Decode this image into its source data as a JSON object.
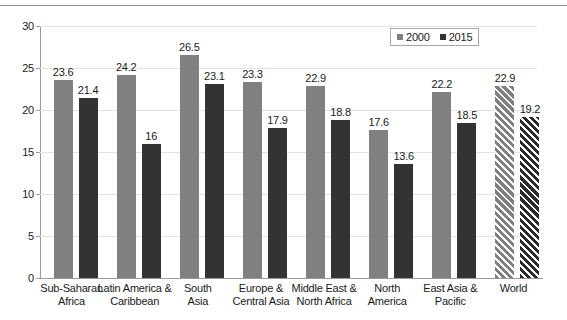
{
  "chart_data": {
    "type": "bar",
    "title": "",
    "subtitle": "",
    "xlabel": "",
    "ylabel": "",
    "ylim": [
      0,
      30
    ],
    "yticks": [
      0,
      5,
      10,
      15,
      20,
      25,
      30
    ],
    "ytick_labels": [
      "0",
      "5",
      "10",
      "15",
      "20",
      "25",
      "30"
    ],
    "grid": true,
    "legend_position": "top-right",
    "categories": [
      "Sub-Saharan Africa",
      "Latin America & Caribbean",
      "South Asia",
      "Europe & Central Asia",
      "Middle East & North Africa",
      "North America",
      "East Asia & Pacific",
      "World"
    ],
    "category_lines": [
      [
        "Sub-Saharan",
        "Africa"
      ],
      [
        "Latin America &",
        "Caribbean"
      ],
      [
        "South",
        "Asia"
      ],
      [
        "Europe &",
        "Central Asia"
      ],
      [
        "Middle East &",
        "North Africa"
      ],
      [
        "North",
        "America"
      ],
      [
        "East Asia &",
        "Pacific"
      ],
      [
        "World",
        ""
      ]
    ],
    "series": [
      {
        "name": "2000",
        "color": "#808080",
        "values": [
          23.6,
          24.2,
          26.5,
          23.3,
          22.9,
          17.6,
          22.2,
          22.9
        ],
        "labels": [
          "23.6",
          "24.2",
          "26.5",
          "23.3",
          "22.9",
          "17.6",
          "22.2",
          "22.9"
        ]
      },
      {
        "name": "2015",
        "color": "#333333",
        "values": [
          21.4,
          16,
          23.1,
          17.9,
          18.8,
          13.6,
          18.5,
          19.2
        ],
        "labels": [
          "21.4",
          "16",
          "23.1",
          "17.9",
          "18.8",
          "13.6",
          "18.5",
          "19.2"
        ]
      }
    ],
    "highlighted_category": "World",
    "highlight_style": "diagonal-hatch"
  },
  "legend": {
    "items": [
      {
        "label": "2000",
        "color": "#808080"
      },
      {
        "label": "2015",
        "color": "#333333"
      }
    ]
  }
}
